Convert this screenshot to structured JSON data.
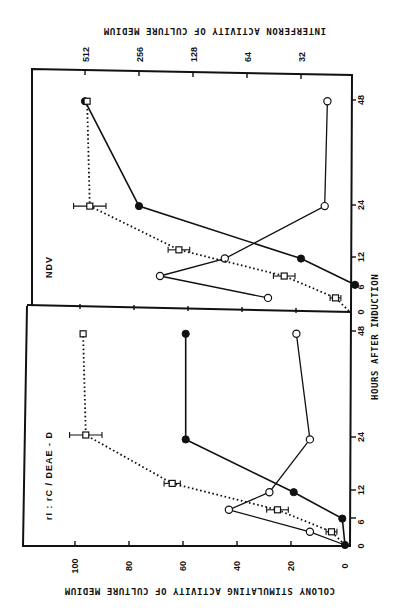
{
  "figure": {
    "orientation": "rotated 90 degrees clockwise (time axis runs bottom-to-top along right edge)",
    "shared_x_axis_title": "HOURS AFTER INDUCTION",
    "left_axis_title": "COLONY STIMULATING ACTIVITY OF CULTURE MEDIUM",
    "right_axis_title": "INTERFERON ACTIVITY OF CULTURE MEDIUM",
    "csa_tick_labels": [
      "100",
      "80",
      "60",
      "40",
      "20",
      "0"
    ],
    "interferon_tick_labels": [
      "512",
      "256",
      "128",
      "64",
      "32"
    ],
    "time_tick_labels": [
      "0",
      "6",
      "12",
      "24",
      "48"
    ]
  },
  "panels": [
    {
      "id": "ndv",
      "label": "NDV"
    },
    {
      "id": "ric",
      "label": "rI : rC / DEAE - D"
    }
  ],
  "chart_data": [
    {
      "type": "line",
      "title": "NDV",
      "xlabel": "HOURS AFTER INDUCTION",
      "ylabel": "COLONY STIMULATING ACTIVITY OF CULTURE MEDIUM",
      "y2label": "INTERFERON ACTIVITY OF CULTURE MEDIUM",
      "x_ticks": [
        0,
        6,
        12,
        24,
        48
      ],
      "ylim": [
        0,
        110
      ],
      "y_ticks": [
        20,
        40,
        60,
        80,
        100
      ],
      "y2_scale": "log2",
      "y2_ticks": [
        32,
        64,
        128,
        256,
        512
      ],
      "grid": false,
      "series": [
        {
          "name": "open-circles (solid line)",
          "marker": "open-circle",
          "line": "solid",
          "axis": "y",
          "x": [
            3,
            8,
            12,
            24,
            48
          ],
          "values": [
            30,
            70,
            46,
            9,
            8
          ]
        },
        {
          "name": "filled-circles (solid line)",
          "marker": "filled-circle",
          "line": "solid",
          "axis": "y2",
          "x": [
            6,
            12,
            24,
            48
          ],
          "values": [
            16,
            32,
            256,
            512
          ]
        },
        {
          "name": "squares with error bars (dotted line)",
          "marker": "open-square",
          "line": "dotted",
          "axis": "y",
          "x": [
            0,
            3,
            8,
            14,
            24,
            48
          ],
          "values": [
            0,
            5,
            24,
            63,
            96,
            97
          ],
          "error": [
            0,
            2,
            4,
            4,
            6,
            0
          ]
        }
      ]
    },
    {
      "type": "line",
      "title": "rI : rC / DEAE - D",
      "xlabel": "HOURS AFTER INDUCTION",
      "ylabel": "COLONY STIMULATING ACTIVITY OF CULTURE MEDIUM",
      "x_ticks": [
        0,
        6,
        12,
        24,
        48
      ],
      "ylim": [
        0,
        110
      ],
      "y_ticks": [
        20,
        40,
        60,
        80,
        100
      ],
      "grid": false,
      "series": [
        {
          "name": "open-circles (solid line)",
          "marker": "open-circle",
          "line": "solid",
          "axis": "y",
          "x": [
            0,
            3,
            8,
            12,
            24,
            48
          ],
          "values": [
            0,
            13,
            43,
            28,
            13,
            18
          ]
        },
        {
          "name": "filled-circles (solid line)",
          "marker": "filled-circle",
          "line": "solid",
          "axis": "y",
          "x": [
            0,
            6,
            12,
            24,
            48
          ],
          "values": [
            0,
            1,
            19,
            59,
            59
          ]
        },
        {
          "name": "squares with error bars (dotted line)",
          "marker": "open-square",
          "line": "dotted",
          "axis": "y",
          "x": [
            0,
            3,
            8,
            14,
            25,
            48
          ],
          "values": [
            0,
            5,
            25,
            64,
            96,
            97
          ],
          "error": [
            0,
            2,
            4,
            3,
            6,
            0
          ]
        }
      ]
    }
  ]
}
